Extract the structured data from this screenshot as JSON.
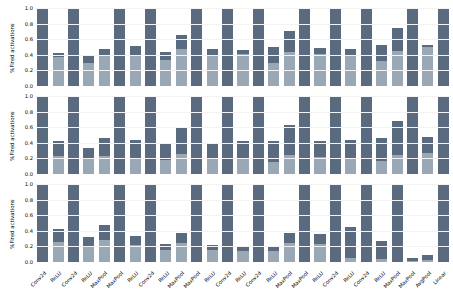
{
  "chart_data": {
    "type": "bar",
    "title": "",
    "xlabel": "",
    "ylabel": "%Fired activations",
    "ylim": [
      0.0,
      1.0
    ],
    "yticks": [
      "0.0",
      "0.2",
      "0.4",
      "0.6",
      "0.8",
      "1.0"
    ],
    "grid": true,
    "legend": "none",
    "stacked": true,
    "subplot_count": 3,
    "colors": {
      "upper_segment": "#5a6b80",
      "lower_segment": "#9aa7b4",
      "gridline": "#f3f3f3",
      "background": "#ffffff"
    },
    "categories": [
      "Conv2d",
      "ReLU",
      "Conv2d",
      "ReLU",
      "MaxPool",
      "MaxPool",
      "ReLU",
      "Conv2d",
      "ReLU",
      "MaxPool",
      "MaxPool",
      "ReLU",
      "Conv2d",
      "ReLU",
      "Conv2d",
      "ReLU",
      "MaxPool",
      "MaxPool",
      "ReLU",
      "Conv2d",
      "ReLU",
      "Conv2d",
      "ReLU",
      "MaxPool",
      "MaxPool",
      "AvgPool",
      "Linear"
    ],
    "subplots": [
      {
        "name": "panel-1",
        "ylabel": "%Fired activations",
        "series": [
          {
            "name": "total",
            "values": [
              1.0,
              0.42,
              1.0,
              0.38,
              0.47,
              1.0,
              0.51,
              1.0,
              0.44,
              0.66,
              1.0,
              0.47,
              1.0,
              0.46,
              1.0,
              0.5,
              0.71,
              1.0,
              0.49,
              1.0,
              0.47,
              1.0,
              0.53,
              0.74,
              1.0,
              0.52,
              1.0
            ]
          },
          {
            "name": "lower",
            "values": [
              0.0,
              0.37,
              0.0,
              0.3,
              0.38,
              0.0,
              0.39,
              0.0,
              0.33,
              0.48,
              0.0,
              0.39,
              0.0,
              0.41,
              0.0,
              0.29,
              0.43,
              0.0,
              0.41,
              0.0,
              0.4,
              0.0,
              0.32,
              0.45,
              0.0,
              0.5,
              0.0
            ]
          }
        ]
      },
      {
        "name": "panel-2",
        "ylabel": "%Fired activations",
        "series": [
          {
            "name": "total",
            "values": [
              1.0,
              0.42,
              1.0,
              0.33,
              0.46,
              1.0,
              0.43,
              1.0,
              0.39,
              0.6,
              1.0,
              0.4,
              1.0,
              0.42,
              1.0,
              0.42,
              0.63,
              1.0,
              0.42,
              1.0,
              0.43,
              1.0,
              0.46,
              0.68,
              1.0,
              0.47,
              1.0
            ]
          },
          {
            "name": "lower",
            "values": [
              0.0,
              0.23,
              0.0,
              0.19,
              0.23,
              0.0,
              0.21,
              0.0,
              0.18,
              0.26,
              0.0,
              0.2,
              0.0,
              0.21,
              0.0,
              0.16,
              0.24,
              0.0,
              0.22,
              0.0,
              0.21,
              0.0,
              0.17,
              0.25,
              0.0,
              0.27,
              0.0
            ]
          }
        ]
      },
      {
        "name": "panel-3",
        "ylabel": "%Fired activations",
        "series": [
          {
            "name": "total",
            "values": [
              1.0,
              0.42,
              1.0,
              0.32,
              0.47,
              1.0,
              0.34,
              1.0,
              0.23,
              0.37,
              1.0,
              0.22,
              1.0,
              0.21,
              1.0,
              0.21,
              0.37,
              1.0,
              0.36,
              1.0,
              0.45,
              1.0,
              0.27,
              1.0,
              0.05,
              0.09,
              1.0
            ]
          },
          {
            "name": "lower",
            "values": [
              0.0,
              0.26,
              0.0,
              0.21,
              0.28,
              0.0,
              0.22,
              0.0,
              0.16,
              0.24,
              0.0,
              0.15,
              0.0,
              0.14,
              0.0,
              0.14,
              0.24,
              0.0,
              0.23,
              0.0,
              0.05,
              0.0,
              0.04,
              0.0,
              0.01,
              0.02,
              0.0
            ]
          }
        ]
      }
    ]
  }
}
